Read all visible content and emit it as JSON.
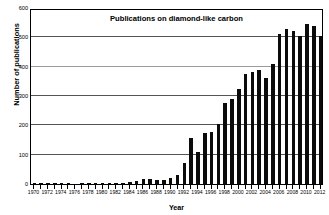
{
  "chart_data": {
    "type": "bar",
    "title": "Publications on diamond-like carbon",
    "xlabel": "Year",
    "ylabel": "Number of publications",
    "ylim": [
      0,
      600
    ],
    "ytick_labels": [
      "0",
      "100",
      "200",
      "300",
      "400",
      "500",
      "600"
    ],
    "ytick_values": [
      0,
      100,
      200,
      300,
      400,
      500,
      600
    ],
    "grid": true,
    "legend": null,
    "xtick_labels": [
      "1970",
      "1972",
      "1974",
      "1976",
      "1978",
      "1980",
      "1982",
      "1984",
      "1986",
      "1988",
      "1990",
      "1992",
      "1994",
      "1996",
      "1998",
      "2000",
      "2002",
      "2004",
      "2006",
      "2008",
      "2010",
      "2012"
    ],
    "categories": [
      "1970",
      "1971",
      "1972",
      "1973",
      "1974",
      "1975",
      "1976",
      "1977",
      "1978",
      "1979",
      "1980",
      "1981",
      "1982",
      "1983",
      "1984",
      "1985",
      "1986",
      "1987",
      "1988",
      "1989",
      "1990",
      "1991",
      "1992",
      "1993",
      "1994",
      "1995",
      "1996",
      "1997",
      "1998",
      "1999",
      "2000",
      "2001",
      "2002",
      "2003",
      "2004",
      "2005",
      "2006",
      "2007",
      "2008",
      "2009",
      "2010",
      "2011",
      "2012"
    ],
    "values": [
      2,
      1,
      1,
      1,
      2,
      1,
      0,
      1,
      1,
      2,
      4,
      1,
      3,
      4,
      6,
      9,
      17,
      18,
      14,
      15,
      22,
      30,
      70,
      158,
      108,
      175,
      177,
      205,
      275,
      290,
      325,
      375,
      383,
      390,
      360,
      408,
      510,
      530,
      522,
      505,
      545,
      537,
      503
    ],
    "bar_color": "#0b0b0b"
  }
}
